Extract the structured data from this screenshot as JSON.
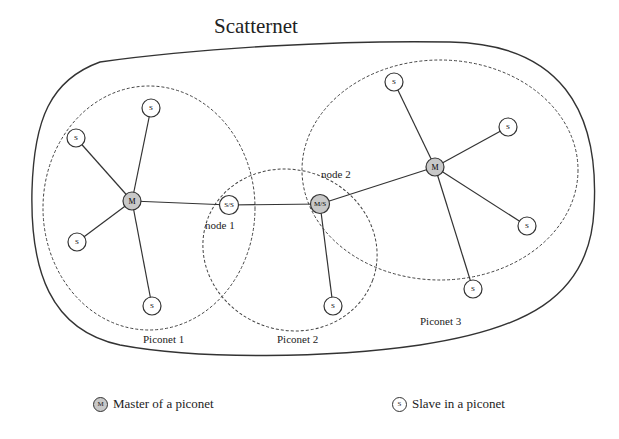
{
  "title": "Scatternet",
  "piconets": [
    {
      "label": "Piconet 1"
    },
    {
      "label": "Piconet 2"
    },
    {
      "label": "Piconet 3"
    }
  ],
  "node_labels": {
    "node1": "node 1",
    "node2": "node 2"
  },
  "nodes": {
    "m1": "M",
    "m3": "M",
    "ss": "S/S",
    "ms": "M/S",
    "s": "S"
  },
  "legend": {
    "master_icon": "M",
    "master_label": "Master of a piconet",
    "slave_icon": "S",
    "slave_label": "Slave in a piconet"
  },
  "colors": {
    "master_fill": "#c8c8c8",
    "slave_fill": "#ffffff",
    "stroke": "#333333"
  }
}
